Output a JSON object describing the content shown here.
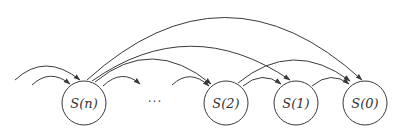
{
  "diagram": {
    "type": "state-transition",
    "nodes": [
      {
        "id": "Sn",
        "label": "S(n)",
        "cx": 84,
        "cy": 103,
        "r": 22
      },
      {
        "id": "S2",
        "label": "S(2)",
        "cx": 226,
        "cy": 103,
        "r": 22
      },
      {
        "id": "S1",
        "label": "S(1)",
        "cx": 296,
        "cy": 103,
        "r": 22
      },
      {
        "id": "S0",
        "label": "S(0)",
        "cx": 365,
        "cy": 103,
        "r": 22
      }
    ],
    "ellipsis": {
      "label": "···",
      "x": 155,
      "y": 106
    },
    "edges": [
      {
        "from": "left",
        "to": "Sn",
        "label": ""
      },
      {
        "from": "left",
        "to": "Sn",
        "label": ""
      },
      {
        "from": "Sn",
        "to": "S0",
        "label": ""
      },
      {
        "from": "Sn",
        "to": "S1",
        "label": ""
      },
      {
        "from": "Sn",
        "to": "S2",
        "label": ""
      },
      {
        "from": "Sn",
        "to": "ellipsis",
        "label": ""
      },
      {
        "from": "ellipsis",
        "to": "S2",
        "label": ""
      },
      {
        "from": "S2",
        "to": "S1",
        "label": ""
      },
      {
        "from": "S2",
        "to": "S0",
        "label": ""
      },
      {
        "from": "S1",
        "to": "S0",
        "label": ""
      }
    ],
    "colors": {
      "stroke": "#3a3a3a",
      "background": "#ffffff"
    }
  }
}
